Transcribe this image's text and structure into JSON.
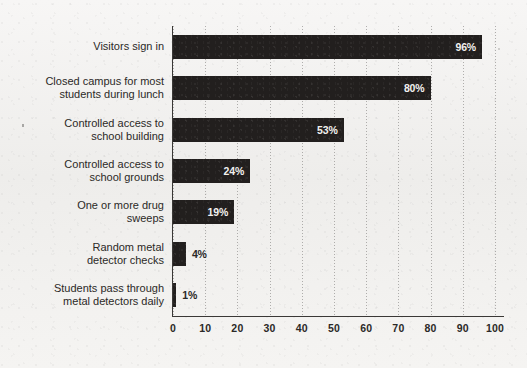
{
  "chart_data": {
    "type": "bar",
    "orientation": "horizontal",
    "title": "",
    "subtitle": "",
    "xlabel": "",
    "ylabel": "",
    "xlim": [
      0,
      100
    ],
    "xticks": [
      "0",
      "10",
      "20",
      "30",
      "40",
      "50",
      "60",
      "70",
      "80",
      "90",
      "100"
    ],
    "grid": "vertical-dotted",
    "legend": "none",
    "value_label_suffix": "%",
    "categories": [
      "Visitors sign in",
      "Closed campus for most students during lunch",
      "Controlled access to school building",
      "Controlled access to school grounds",
      "One or more drug sweeps",
      "Random metal detector checks",
      "Students pass through metal detectors daily"
    ],
    "values": [
      96,
      80,
      53,
      24,
      19,
      4,
      1
    ],
    "data_labels": [
      "96%",
      "80%",
      "53%",
      "24%",
      "19%",
      "4%",
      "1%"
    ],
    "bars": [
      {
        "label_line1": "Visitors sign in",
        "label_line2": "",
        "value": 96,
        "data_label": "96%",
        "label_placement": "inside"
      },
      {
        "label_line1": "Closed campus for most",
        "label_line2": "students during lunch",
        "value": 80,
        "data_label": "80%",
        "label_placement": "inside"
      },
      {
        "label_line1": "Controlled access to",
        "label_line2": "school building",
        "value": 53,
        "data_label": "53%",
        "label_placement": "inside"
      },
      {
        "label_line1": "Controlled access to",
        "label_line2": "school grounds",
        "value": 24,
        "data_label": "24%",
        "label_placement": "inside"
      },
      {
        "label_line1": "One or more drug",
        "label_line2": "sweeps",
        "value": 19,
        "data_label": "19%",
        "label_placement": "inside"
      },
      {
        "label_line1": "Random metal",
        "label_line2": "detector checks",
        "value": 4,
        "data_label": "4%",
        "label_placement": "outside"
      },
      {
        "label_line1": "Students pass through",
        "label_line2": "metal detectors daily",
        "value": 1,
        "data_label": "1%",
        "label_placement": "outside"
      }
    ],
    "colors": {
      "bar": "#221f1e",
      "background": "#f3f2f0",
      "axis": "#3a3836",
      "text": "#2b2927",
      "inside_label_text": "#f2f1ef",
      "gridline": "#787674"
    }
  }
}
